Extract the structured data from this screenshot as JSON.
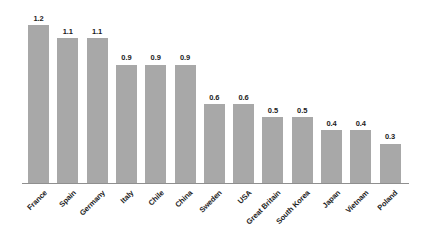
{
  "chart_data": {
    "type": "bar",
    "title": "",
    "subtitle": "",
    "xlabel": "",
    "ylabel": "",
    "ylim": [
      0,
      1.3
    ],
    "grid": false,
    "legend": false,
    "bar_color": "#a8a8a8",
    "axis_color": "#8f8f8f",
    "label_color": "#1c1c1c",
    "value_label_format": "one-decimal",
    "categories": [
      "France",
      "Spain",
      "Germany",
      "Italy",
      "Chile",
      "China",
      "Sweden",
      "USA",
      "Great Britain",
      "South Korea",
      "Japan",
      "Vietnam",
      "Poland"
    ],
    "values": [
      1.2,
      1.1,
      1.1,
      0.9,
      0.9,
      0.9,
      0.6,
      0.6,
      0.5,
      0.5,
      0.4,
      0.4,
      0.3
    ],
    "value_labels": [
      "1.2",
      "1.1",
      "1.1",
      "0.9",
      "0.9",
      "0.9",
      "0.6",
      "0.6",
      "0.5",
      "0.5",
      "0.4",
      "0.4",
      "0.3"
    ]
  }
}
